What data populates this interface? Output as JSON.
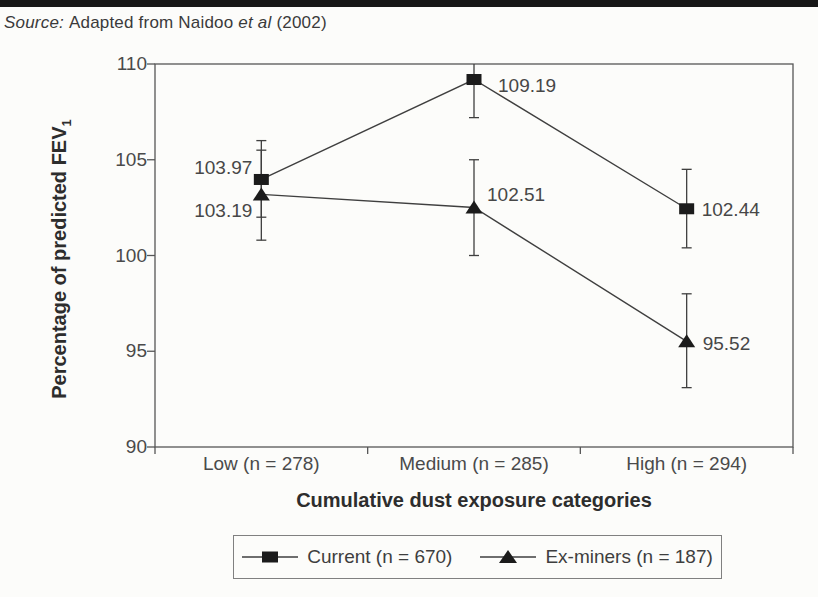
{
  "page": {
    "source_prefix": "Source:",
    "source_mid": "Adapted from Naidoo",
    "source_etal": "et al",
    "source_suffix": "(2002)"
  },
  "chart_data": {
    "type": "line",
    "title": "",
    "xlabel": "Cumulative dust exposure categories",
    "ylabel": "Percentage of predicted FEV",
    "ylabel_subscript": "1",
    "categories": [
      "Low (n = 278)",
      "Medium (n = 285)",
      "High (n = 294)"
    ],
    "ylim": [
      90,
      110
    ],
    "yticks": [
      90,
      95,
      100,
      105,
      110
    ],
    "grid": false,
    "legend_position": "bottom",
    "series": [
      {
        "name": "Current (n = 670)",
        "marker": "square",
        "values": [
          103.97,
          109.19,
          102.44
        ],
        "labels": [
          "103.97",
          "109.19",
          "102.44"
        ],
        "error_low": [
          102.0,
          107.2,
          100.4
        ],
        "error_high": [
          106.0,
          111.2,
          104.5
        ]
      },
      {
        "name": "Ex-miners (n = 187)",
        "marker": "triangle",
        "values": [
          103.19,
          102.51,
          95.52
        ],
        "labels": [
          "103.19",
          "102.51",
          "95.52"
        ],
        "error_low": [
          100.8,
          100.0,
          93.1
        ],
        "error_high": [
          105.5,
          105.0,
          98.0
        ]
      }
    ],
    "colors": {
      "line": "#3f3f3f",
      "marker": "#1b1b1b",
      "frame": "#565656",
      "text": "#4a4a4a"
    }
  }
}
